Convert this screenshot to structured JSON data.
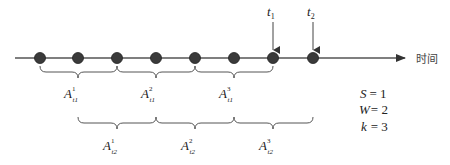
{
  "diagram": {
    "axis_label": "时间",
    "time_markers": [
      {
        "base": "t",
        "sub": "1",
        "x": 273
      },
      {
        "base": "t",
        "sub": "2",
        "x": 313
      }
    ],
    "dots_x": [
      40,
      78,
      117,
      156,
      195,
      234,
      273,
      313
    ],
    "window_labels_t1": [
      {
        "base": "A",
        "sup": "1",
        "sub": "t1"
      },
      {
        "base": "A",
        "sup": "2",
        "sub": "t1"
      },
      {
        "base": "A",
        "sup": "3",
        "sub": "t1"
      }
    ],
    "window_labels_t2": [
      {
        "base": "A",
        "sup": "1",
        "sub": "t2"
      },
      {
        "base": "A",
        "sup": "2",
        "sub": "t2"
      },
      {
        "base": "A",
        "sup": "3",
        "sub": "t2"
      }
    ],
    "params": [
      {
        "name": "S",
        "eq": "= 1"
      },
      {
        "name": "W",
        "eq": "= 2"
      },
      {
        "name": "k",
        "eq": "= 3"
      }
    ],
    "colors": {
      "dot": "#3a3a3a",
      "line": "#555555"
    }
  }
}
